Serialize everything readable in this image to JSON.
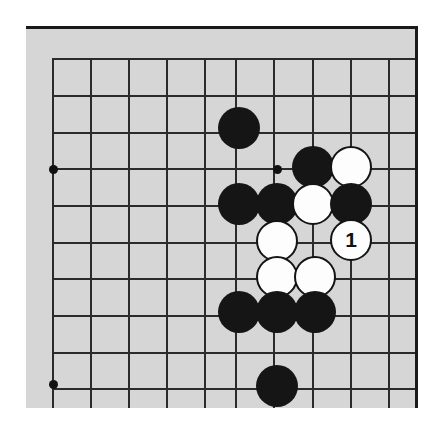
{
  "diagram": {
    "type": "go-board-diagram",
    "board_background_color": "#d6d6d6",
    "line_color": "#2b2b2b",
    "black_stone_color": "#151515",
    "white_stone_color": "#fdfdfd",
    "page_background_color": "#ffffff",
    "visible_columns": 10,
    "visible_rows": 10,
    "column_x": [
      52,
      90,
      128,
      166,
      204,
      235,
      273,
      312,
      350,
      388
    ],
    "row_y": [
      58,
      95,
      132,
      168,
      205,
      242,
      278,
      315,
      352,
      388
    ],
    "star_points": [
      {
        "x": 52,
        "y": 168
      },
      {
        "x": 52,
        "y": 383
      },
      {
        "x": 276,
        "y": 168
      }
    ],
    "stones": [
      {
        "color": "black",
        "x": 238,
        "y": 127,
        "label": ""
      },
      {
        "color": "black",
        "x": 312,
        "y": 166,
        "label": ""
      },
      {
        "color": "white",
        "x": 350,
        "y": 166,
        "label": ""
      },
      {
        "color": "black",
        "x": 238,
        "y": 203,
        "label": ""
      },
      {
        "color": "black",
        "x": 276,
        "y": 203,
        "label": ""
      },
      {
        "color": "white",
        "x": 312,
        "y": 203,
        "label": ""
      },
      {
        "color": "black",
        "x": 350,
        "y": 203,
        "label": ""
      },
      {
        "color": "white",
        "x": 276,
        "y": 240,
        "label": ""
      },
      {
        "color": "white",
        "x": 350,
        "y": 239,
        "label": "1"
      },
      {
        "color": "white",
        "x": 276,
        "y": 276,
        "label": ""
      },
      {
        "color": "white",
        "x": 314,
        "y": 276,
        "label": ""
      },
      {
        "color": "black",
        "x": 238,
        "y": 311,
        "label": ""
      },
      {
        "color": "black",
        "x": 276,
        "y": 311,
        "label": ""
      },
      {
        "color": "black",
        "x": 314,
        "y": 311,
        "label": ""
      },
      {
        "color": "black",
        "x": 276,
        "y": 385,
        "label": ""
      }
    ],
    "move_marker": {
      "number": "1",
      "stone_color": "white",
      "x": 350,
      "y": 239
    }
  }
}
